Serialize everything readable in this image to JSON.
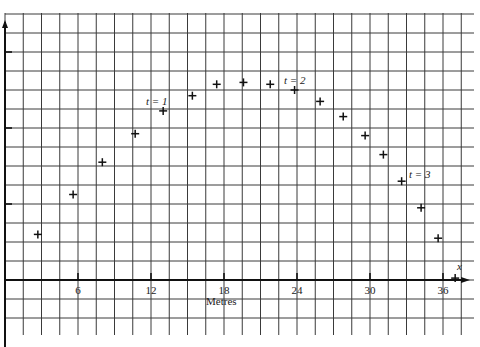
{
  "chart_data": {
    "type": "scatter",
    "title": "",
    "xlabel": "Metres",
    "ylabel": "",
    "x_axis_symbol": "x",
    "x_ticks": [
      6,
      12,
      18,
      24,
      30,
      36
    ],
    "x_tick_labels": [
      "6",
      "12",
      "18",
      "24",
      "30",
      "36"
    ],
    "xlim": [
      0,
      38.5
    ],
    "y_ticks_unlabeled": true,
    "y_units": "grid cells (unlabeled)",
    "ylim": [
      -3.5,
      14
    ],
    "grid": true,
    "grid_spacing_x_m": 1.5,
    "marker": "+",
    "series": [
      {
        "name": "positions",
        "x": [
          2.7,
          5.6,
          8.0,
          10.7,
          13.0,
          15.4,
          17.4,
          19.6,
          21.8,
          23.8,
          25.9,
          27.8,
          29.6,
          31.1,
          32.6,
          34.2,
          35.6,
          37.0
        ],
        "y": [
          2.4,
          4.5,
          6.2,
          7.7,
          8.9,
          9.7,
          10.3,
          10.4,
          10.3,
          10.0,
          9.4,
          8.6,
          7.6,
          6.6,
          5.2,
          3.8,
          2.2,
          0.1
        ]
      }
    ],
    "annotations": [
      {
        "text": "t = 1",
        "x": 13.0,
        "y": 8.9
      },
      {
        "text": "t = 2",
        "x": 23.8,
        "y": 10.0
      },
      {
        "text": "t = 3",
        "x": 32.6,
        "y": 5.2
      }
    ]
  },
  "labels": {
    "xlabel": "Metres",
    "x_symbol": "x",
    "ticks": [
      "6",
      "12",
      "18",
      "24",
      "30",
      "36"
    ],
    "ann1": "t = 1",
    "ann2": "t = 2",
    "ann3": "t = 3"
  }
}
